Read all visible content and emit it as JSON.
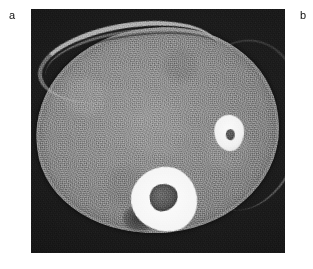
{
  "figure": {
    "type": "medical-imaging-figure",
    "modality": "CT",
    "colormap": "grayscale",
    "panels": [
      {
        "id": "panel-a",
        "label": "a",
        "label_position": "top-left",
        "has_image": true,
        "description": "Axial CT cross-section of an oval body with two bright high-attenuation lesions, each containing a darker central region, on a dark noisy background."
      },
      {
        "id": "panel-b",
        "label": "b",
        "label_position": "top-right",
        "has_image": false,
        "description": "Label only; panel image not visible in this crop."
      }
    ]
  },
  "labels": {
    "a": "a",
    "b": "b"
  },
  "scan": {
    "background_color": "#1d1d1d",
    "tissue_color": "#8e8e8e",
    "lesion_color": "#f7f7f7",
    "lesion_core_color": "#575757",
    "wall_color": "#cdcdcd",
    "features": [
      {
        "name": "body-cross-section",
        "kind": "soft-tissue-ellipse",
        "value": "mid-gray noisy oval occupying most of the frame"
      },
      {
        "name": "anterior-wall-band",
        "kind": "bright-curved-band",
        "value": "bright arc along the upper-left border of the body"
      },
      {
        "name": "lesion-large",
        "kind": "hyperdense-lesion",
        "value": "large bright lesion with mottled dark center, lower-center of the body"
      },
      {
        "name": "lesion-small",
        "kind": "hyperdense-lesion",
        "value": "small bright lesion with small dark center, right of midline"
      }
    ]
  }
}
